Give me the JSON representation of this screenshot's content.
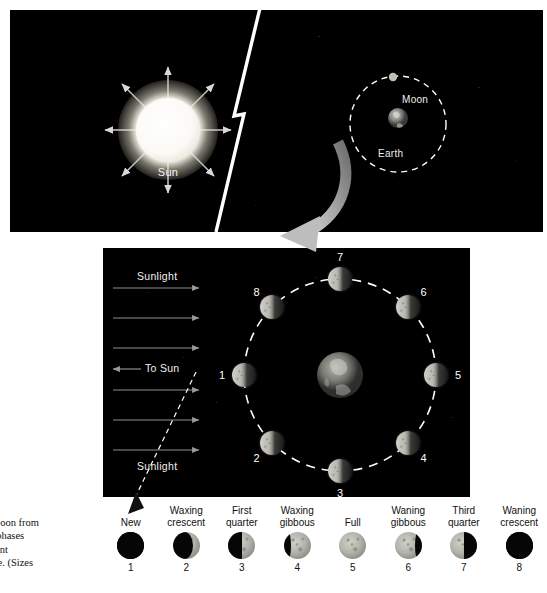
{
  "figure": {
    "caption_lines": [
      "of the Moon from",
      "in. The phases",
      "g different",
      "d surface. (Sizes"
    ]
  },
  "top_panel": {
    "sun": {
      "label": "Sun",
      "ray_count": 8,
      "color": "#ffffff"
    },
    "earth_moon_inset": {
      "earth_label": "Earth",
      "moon_label": "Moon",
      "orbit_style": "dashed",
      "orbit_color": "#ffffff"
    },
    "divider": "lightning-break",
    "background": "#000000"
  },
  "bottom_panel": {
    "background": "#000000",
    "sunlight": {
      "label_top": "Sunlight",
      "label_bottom": "Sunlight",
      "to_sun_label": "To Sun",
      "arrow_count": 6,
      "arrow_color": "#9a9a9a"
    },
    "earth_label": "",
    "orbit_color": "#ffffff",
    "moon_positions": [
      {
        "number": "1",
        "angle_deg": 180,
        "phase": "new"
      },
      {
        "number": "2",
        "angle_deg": 225,
        "phase": "waxing-crescent"
      },
      {
        "number": "3",
        "angle_deg": 270,
        "phase": "first-quarter"
      },
      {
        "number": "4",
        "angle_deg": 315,
        "phase": "waxing-gibbous"
      },
      {
        "number": "5",
        "angle_deg": 0,
        "phase": "full"
      },
      {
        "number": "6",
        "angle_deg": 45,
        "phase": "waning-gibbous"
      },
      {
        "number": "7",
        "angle_deg": 90,
        "phase": "third-quarter"
      },
      {
        "number": "8",
        "angle_deg": 135,
        "phase": "waning-crescent"
      }
    ]
  },
  "phase_strip": {
    "phases": [
      {
        "index": "1",
        "name_line1": "New",
        "name_line2": "",
        "illum": 0.0,
        "lit_side": "none"
      },
      {
        "index": "2",
        "name_line1": "Waxing",
        "name_line2": "crescent",
        "illum": 0.25,
        "lit_side": "right"
      },
      {
        "index": "3",
        "name_line1": "First",
        "name_line2": "quarter",
        "illum": 0.5,
        "lit_side": "right"
      },
      {
        "index": "4",
        "name_line1": "Waxing",
        "name_line2": "gibbous",
        "illum": 0.75,
        "lit_side": "right"
      },
      {
        "index": "5",
        "name_line1": "Full",
        "name_line2": "",
        "illum": 1.0,
        "lit_side": "full"
      },
      {
        "index": "6",
        "name_line1": "Waning",
        "name_line2": "gibbous",
        "illum": 0.75,
        "lit_side": "left"
      },
      {
        "index": "7",
        "name_line1": "Third",
        "name_line2": "quarter",
        "illum": 0.5,
        "lit_side": "left"
      },
      {
        "index": "8",
        "name_line1": "Waning",
        "name_line2": "crescent",
        "illum": 0.0,
        "lit_side": "none"
      }
    ]
  }
}
